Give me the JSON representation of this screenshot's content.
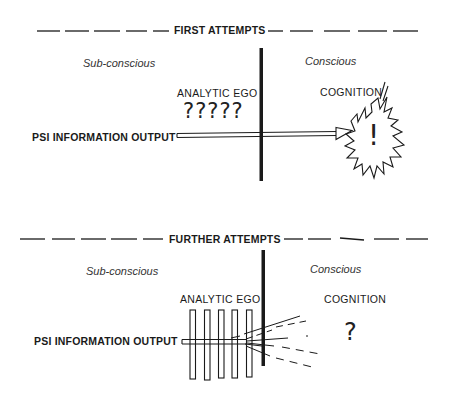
{
  "figure": {
    "panels": [
      {
        "id": "first",
        "title": "FIRST ATTEMPTS",
        "left_region": "Sub-conscious",
        "right_region": "Conscious",
        "ego_label": "ANALYTIC EGO",
        "ego_marks": "?????",
        "input_label": "PSI INFORMATION OUTPUT",
        "output_label": "COGNITION",
        "output_symbol": "!",
        "output_shape": "starburst",
        "channel": "clear arrow passes barrier"
      },
      {
        "id": "further",
        "title": "FURTHER ATTEMPTS",
        "left_region": "Sub-conscious",
        "right_region": "Conscious",
        "ego_label": "ANALYTIC EGO",
        "ego_plates": 5,
        "input_label": "PSI INFORMATION OUTPUT",
        "output_label": "COGNITION",
        "output_symbol": "?",
        "channel": "signal scattered into dashed lines at barrier"
      }
    ],
    "colors": {
      "ink": "#1a1a1a",
      "background": "#ffffff"
    }
  }
}
